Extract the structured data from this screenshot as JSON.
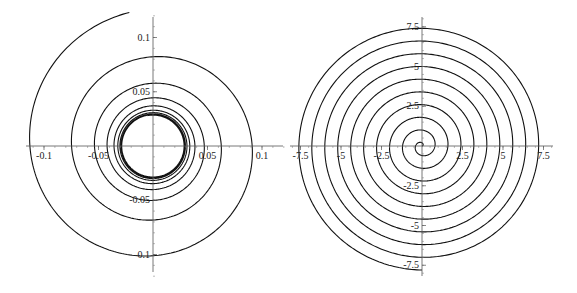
{
  "chart_data": [
    {
      "type": "line",
      "title": "",
      "description": "Parametric spiral converging inward toward a limit cycle (radius ~0.028)",
      "xlabel": "",
      "ylabel": "",
      "xlim": [
        -0.11,
        0.12
      ],
      "ylim": [
        -0.125,
        0.13
      ],
      "x_ticks": [
        -0.1,
        -0.05,
        0.05,
        0.1
      ],
      "x_tick_labels": [
        "-0.1",
        "-0.05",
        "0.05",
        "0.1"
      ],
      "y_ticks": [
        0.1,
        0.05,
        -0.05,
        -0.1
      ],
      "y_tick_labels": [
        "0.1",
        "0.05",
        "-0.05",
        "-0.1"
      ],
      "grid": false,
      "legend": null,
      "spiral": {
        "start_radius": 0.125,
        "start_angle_deg": 100,
        "limit_radius": 0.028,
        "decay_per_turn": 0.55,
        "turns": 9,
        "direction": "counterclockwise"
      },
      "sample_points": [
        {
          "x": -0.02,
          "y": 0.118
        },
        {
          "x": -0.105,
          "y": 0.0
        },
        {
          "x": 0.0,
          "y": -0.085
        },
        {
          "x": 0.08,
          "y": 0.0
        },
        {
          "x": 0.0,
          "y": 0.07
        },
        {
          "x": -0.06,
          "y": 0.0
        },
        {
          "x": 0.0,
          "y": -0.058
        },
        {
          "x": 0.052,
          "y": 0.0
        },
        {
          "x": 0.0,
          "y": 0.047
        }
      ]
    },
    {
      "type": "line",
      "title": "",
      "description": "Archimedean spiral r = a·θ starting at origin",
      "xlabel": "",
      "ylabel": "",
      "xlim": [
        -8,
        8
      ],
      "ylim": [
        -8.2,
        8.2
      ],
      "x_ticks": [
        -7.5,
        -5,
        -2.5,
        2.5,
        5,
        7.5
      ],
      "x_tick_labels": [
        "-7.5",
        "-5",
        "-2.5",
        "2.5",
        "5",
        "7.5"
      ],
      "y_ticks": [
        7.5,
        5,
        2.5,
        -2.5,
        -5,
        -7.5
      ],
      "y_tick_labels": [
        "7.5",
        "5",
        "2.5",
        "-2.5",
        "-5",
        "-7.5"
      ],
      "grid": false,
      "legend": null,
      "spiral": {
        "a": 0.127,
        "turns": 9.75,
        "direction": "counterclockwise",
        "end_radius": 7.8
      },
      "sample_points": [
        {
          "x": 0,
          "y": 0
        },
        {
          "x": -0.1,
          "y": 1.0
        },
        {
          "x": -1.5,
          "y": 0
        },
        {
          "x": 0,
          "y": -2.3
        },
        {
          "x": 3.1,
          "y": 0
        },
        {
          "x": 0,
          "y": 3.9
        },
        {
          "x": -4.7,
          "y": 0
        },
        {
          "x": 7.8,
          "y": 0
        }
      ]
    }
  ]
}
